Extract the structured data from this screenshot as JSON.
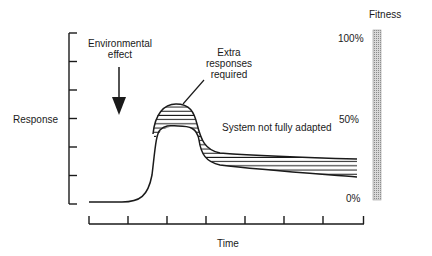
{
  "diagram": {
    "y_axis_label": "Response",
    "x_axis_label": "Time",
    "annotations": {
      "environmental_effect_line1": "Environmental",
      "environmental_effect_line2": "effect",
      "extra_responses_line1": "Extra",
      "extra_responses_line2": "responses",
      "extra_responses_line3": "required",
      "system_not_adapted": "System not fully adapted"
    },
    "fitness_scale": {
      "title": "Fitness",
      "ticks": [
        "100%",
        "50%",
        "0%"
      ]
    },
    "y_axis_tick_count": 7,
    "x_axis_tick_count": 8,
    "colors": {
      "line": "#1a1a1a",
      "fitness_bar_fill": "#bdbdbd",
      "background": "#ffffff"
    }
  }
}
